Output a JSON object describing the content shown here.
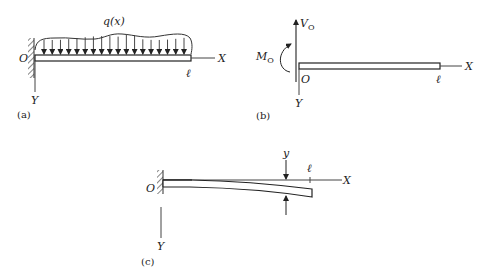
{
  "figure": {
    "panels": [
      {
        "id": "a",
        "label": "(a)",
        "load_label": "q(x)",
        "origin_label": "O",
        "x_axis_label": "X",
        "y_axis_label": "Y",
        "length_label": "ℓ",
        "load_arrow_count": 18,
        "support": "fixed-wall"
      },
      {
        "id": "b",
        "label": "(b)",
        "shear_label": "V",
        "shear_sub": "O",
        "moment_label": "M",
        "moment_sub": "O",
        "origin_label": "O",
        "x_axis_label": "X",
        "y_axis_label": "Y",
        "length_label": "ℓ"
      },
      {
        "id": "c",
        "label": "(c)",
        "deflection_label": "y",
        "origin_label": "O",
        "x_axis_label": "X",
        "y_axis_label": "Y",
        "length_label": "ℓ",
        "support": "fixed-wall"
      }
    ]
  }
}
